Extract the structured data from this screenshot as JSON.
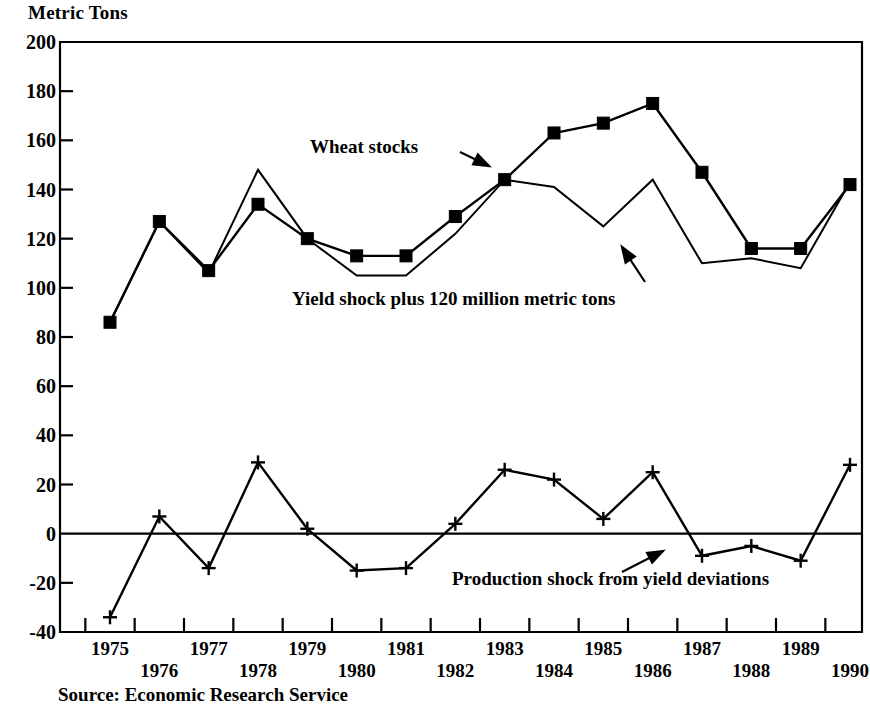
{
  "chart_data": {
    "type": "line",
    "title": "",
    "ylabel": "Metric Tons",
    "xlabel": "",
    "ylim": [
      -40,
      200
    ],
    "ytick_step": 20,
    "grid": false,
    "legend": "annotations-inline",
    "categories": [
      "1975",
      "1976",
      "1977",
      "1978",
      "1979",
      "1980",
      "1981",
      "1982",
      "1983",
      "1984",
      "1985",
      "1986",
      "1987",
      "1988",
      "1989",
      "1990"
    ],
    "ytick_labels": [
      "200",
      "180",
      "160",
      "140",
      "120",
      "100",
      "80",
      "60",
      "40",
      "20",
      "0",
      "-20",
      "-40"
    ],
    "ytick_values": [
      200,
      180,
      160,
      140,
      120,
      100,
      80,
      60,
      40,
      20,
      0,
      -20,
      -40
    ],
    "series": [
      {
        "name": "Wheat stocks",
        "marker": "filled-square",
        "values": [
          86,
          127,
          107,
          134,
          120,
          113,
          113,
          129,
          144,
          163,
          167,
          175,
          147,
          116,
          116,
          142
        ]
      },
      {
        "name": "Yield shock plus 120 million metric tons",
        "marker": "none",
        "values": [
          86,
          127,
          106,
          148,
          120,
          105,
          105,
          122,
          144,
          141,
          125,
          144,
          110,
          112,
          108,
          143
        ]
      },
      {
        "name": "Production shock from yield deviations",
        "marker": "plus",
        "values": [
          -34,
          7,
          -14,
          29,
          2,
          -15,
          -14,
          4,
          26,
          22,
          6,
          25,
          -9,
          -5,
          -11,
          28
        ]
      }
    ],
    "annotations": [
      {
        "text": "Wheat stocks",
        "target_series": "Wheat stocks"
      },
      {
        "text": "Yield shock plus 120 million metric tons",
        "target_series": "Yield shock plus 120 million metric tons"
      },
      {
        "text": "Production shock from yield deviations",
        "target_series": "Production shock from yield deviations"
      }
    ],
    "source": "Source: Economic Research Service",
    "colors": {
      "ink": "#000000",
      "background": "#ffffff"
    }
  }
}
